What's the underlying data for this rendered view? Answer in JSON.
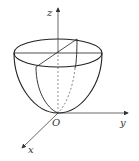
{
  "diagram": {
    "type": "3d-surface-sketch",
    "surface": "paraboloid",
    "axes": {
      "x_label": "x",
      "y_label": "y",
      "z_label": "z",
      "origin_label": "O"
    },
    "colors": {
      "stroke": "#222222",
      "axis": "#444444",
      "background": "#ffffff"
    }
  }
}
